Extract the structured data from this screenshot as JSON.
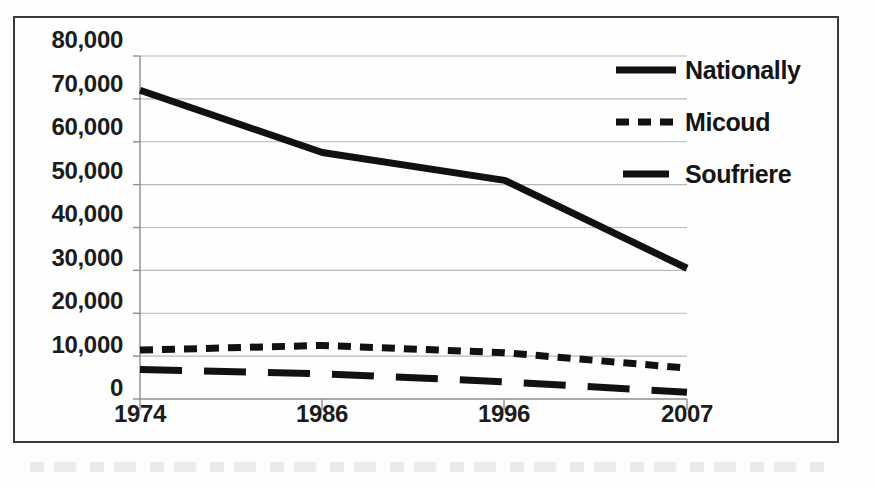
{
  "figure": {
    "border_color": "#3a3a3a",
    "background": "#fefefe"
  },
  "legend": {
    "position": "top-right",
    "entries": [
      {
        "label": "Nationally",
        "style": "solid",
        "swatch_name": "legend-swatch-nationally"
      },
      {
        "label": "Micoud",
        "style": "dotted",
        "swatch_name": "legend-swatch-micoud"
      },
      {
        "label": "Soufriere",
        "style": "long-dashed",
        "swatch_name": "legend-swatch-soufriere"
      }
    ]
  },
  "axes": {
    "y_tick_labels": [
      "80,000",
      "70,000",
      "60,000",
      "50,000",
      "40,000",
      "30,000",
      "20,000",
      "10,000",
      "0"
    ],
    "x_tick_labels": [
      "1974",
      "1986",
      "1996",
      "2007"
    ]
  },
  "chart_data": {
    "type": "line",
    "title": "",
    "subtitle": "",
    "xlabel": "",
    "ylabel": "",
    "categories": [
      "1974",
      "1986",
      "1996",
      "2007"
    ],
    "x": [
      1974,
      1986,
      1996,
      2007
    ],
    "series": [
      {
        "name": "Nationally",
        "values": [
          72000,
          57500,
          51000,
          30500
        ],
        "style": "solid",
        "color": "#111111",
        "width": 7
      },
      {
        "name": "Micoud",
        "values": [
          11400,
          12500,
          10800,
          7200
        ],
        "style": "dotted",
        "color": "#111111",
        "width": 7
      },
      {
        "name": "Soufriere",
        "values": [
          6900,
          5900,
          4000,
          1600
        ],
        "style": "long-dashed",
        "color": "#111111",
        "width": 7
      }
    ],
    "ylim": [
      0,
      80000
    ],
    "ytick_step": 10000,
    "grid": "horizontal",
    "grid_color": "#b9b9b9",
    "legend_position": "top-right"
  }
}
